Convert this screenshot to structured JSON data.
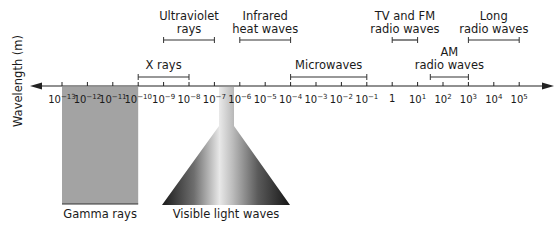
{
  "diagram": {
    "y_axis_label": "Wavelength (m)",
    "axis": {
      "y": 86,
      "x_start": 30,
      "x_end": 554,
      "tick_spacing": 25.4,
      "first_tick_x": 62,
      "ticks": [
        {
          "base": "10",
          "exp": "−13"
        },
        {
          "base": "10",
          "exp": "−12"
        },
        {
          "base": "10",
          "exp": "−11"
        },
        {
          "base": "10",
          "exp": "−10"
        },
        {
          "base": "10",
          "exp": "−9"
        },
        {
          "base": "10",
          "exp": "−8"
        },
        {
          "base": "10",
          "exp": "−7"
        },
        {
          "base": "10",
          "exp": "−6"
        },
        {
          "base": "10",
          "exp": "−5"
        },
        {
          "base": "10",
          "exp": "−4"
        },
        {
          "base": "10",
          "exp": "−3"
        },
        {
          "base": "10",
          "exp": "−2"
        },
        {
          "base": "10",
          "exp": "−1"
        },
        {
          "base": "1",
          "exp": ""
        },
        {
          "base": "10",
          "exp": "1"
        },
        {
          "base": "10",
          "exp": "2"
        },
        {
          "base": "10",
          "exp": "3"
        },
        {
          "base": "10",
          "exp": "4"
        },
        {
          "base": "10",
          "exp": "5"
        }
      ]
    },
    "bands": [
      {
        "name": "ultraviolet",
        "label": "Ultraviolet\nrays",
        "from": 4,
        "to": 6,
        "bracket_y": 40,
        "label_y": 10
      },
      {
        "name": "infrared",
        "label": "Infrared\nheat waves",
        "from": 7,
        "to": 9,
        "bracket_y": 40,
        "label_y": 10
      },
      {
        "name": "tv-fm",
        "label": "TV and FM\nradio waves",
        "from": 13,
        "to": 14,
        "bracket_y": 40,
        "label_y": 10
      },
      {
        "name": "long-radio",
        "label": "Long\nradio waves",
        "from": 16,
        "to": 18,
        "bracket_y": 40,
        "label_y": 10
      },
      {
        "name": "x-rays",
        "label": "X rays",
        "from": 3,
        "to": 5,
        "bracket_y": 77,
        "label_y": 59
      },
      {
        "name": "microwaves",
        "label": "Microwaves",
        "from": 9,
        "to": 12,
        "bracket_y": 77,
        "label_y": 59
      },
      {
        "name": "am-radio",
        "label": "AM\nradio waves",
        "from": 14.5,
        "to": 16,
        "bracket_y": 77,
        "label_y": 46
      }
    ],
    "gamma": {
      "label": "Gamma rays",
      "from": 0,
      "to": 3,
      "color": "#a3a3a3",
      "bottom": 204
    },
    "visible": {
      "label": "Visible light waves",
      "stem_left": 219,
      "stem_right": 234,
      "cone_left": 162,
      "cone_right": 290,
      "cone_top": 126,
      "bottom": 205
    }
  }
}
